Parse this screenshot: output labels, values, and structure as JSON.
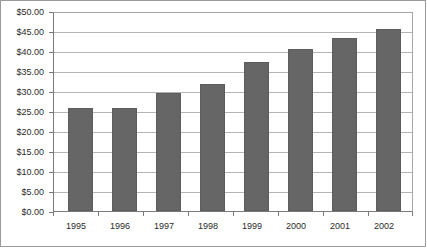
{
  "chart_data": {
    "type": "bar",
    "title": "",
    "subtitle": "",
    "xlabel": "",
    "ylabel": "",
    "categories": [
      "1995",
      "1996",
      "1997",
      "1998",
      "1999",
      "2000",
      "2001",
      "2002"
    ],
    "values": [
      26.0,
      26.0,
      29.8,
      32.0,
      37.5,
      41.0,
      43.8,
      46.0
    ],
    "series": [
      {
        "name": "",
        "values": [
          26.0,
          26.0,
          29.8,
          32.0,
          37.5,
          41.0,
          43.8,
          46.0
        ]
      }
    ],
    "ylim": [
      0,
      50
    ],
    "ytick_values": [
      50,
      45,
      40,
      35,
      30,
      25,
      20,
      15,
      10,
      5,
      0
    ],
    "ytick_labels": [
      "$50.00",
      "$45.00",
      "$40.00",
      "$35.00",
      "$30.00",
      "$25.00",
      "$20.00",
      "$15.00",
      "$10.00",
      "$5.00",
      "$0.00"
    ],
    "grid": true,
    "grid_axis": "y",
    "legend": false,
    "legend_position": "none",
    "bar_color": "#666666",
    "bar_border_color": "#5c5c5c",
    "gridline_color": "#b5b5b5",
    "axis_color": "#7a7a7a",
    "frame_color": "#9a9a9a",
    "plot_background": "#ffffff",
    "text_color": "#2b2b2b",
    "annotations": []
  }
}
